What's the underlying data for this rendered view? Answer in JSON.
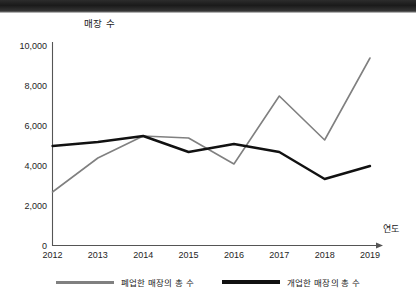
{
  "chart_data": {
    "type": "line",
    "title": "",
    "xlabel": "연도",
    "ylabel": "매장 수",
    "categories": [
      "2012",
      "2013",
      "2014",
      "2015",
      "2016",
      "2017",
      "2018",
      "2019"
    ],
    "x": [
      2012,
      2013,
      2014,
      2015,
      2016,
      2017,
      2018,
      2019
    ],
    "ylim": [
      0,
      10000
    ],
    "yticks": [
      0,
      2000,
      4000,
      6000,
      8000,
      10000
    ],
    "ytick_labels": [
      "0",
      "2,000",
      "4,000",
      "6,000",
      "8,000",
      "10,000"
    ],
    "grid": false,
    "legend_position": "bottom",
    "series": [
      {
        "name": "폐업한 매장의 총 수",
        "color": "#808080",
        "line_width": 1.6,
        "values": [
          2700,
          4400,
          5500,
          5400,
          4100,
          7500,
          5300,
          9400
        ]
      },
      {
        "name": "개업한 매장의 총 수",
        "color": "#111111",
        "line_width": 2.4,
        "values": [
          5000,
          5200,
          5500,
          4700,
          5100,
          4700,
          3350,
          4000
        ]
      }
    ]
  },
  "legend": {
    "items": [
      {
        "label": "폐업한 매장의 총 수",
        "color": "#808080"
      },
      {
        "label": "개업한 매장의 총 수",
        "color": "#111111"
      }
    ]
  },
  "axes": {
    "y_title": "매장 수",
    "x_title": "연도"
  }
}
